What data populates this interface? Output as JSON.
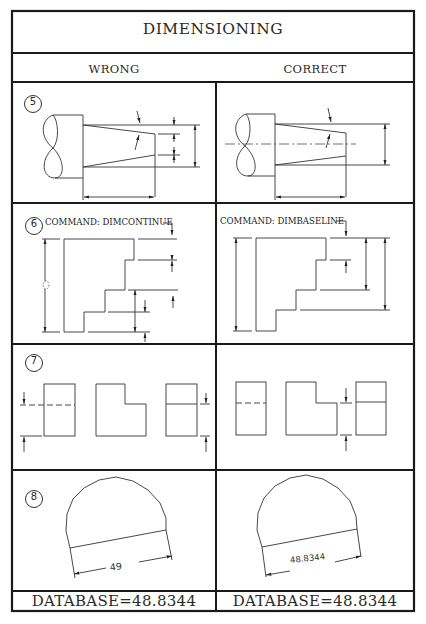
{
  "title": "DIMENSIONING",
  "columns": {
    "wrong": "WRONG",
    "correct": "CORRECT"
  },
  "rows": [
    {
      "number": "5",
      "wrong": {
        "command": ""
      },
      "correct": {
        "command": ""
      }
    },
    {
      "number": "6",
      "wrong": {
        "command": "COMMAND: DIMCONTINUE"
      },
      "correct": {
        "command": "COMMAND: DIMBASELINE"
      }
    },
    {
      "number": "7",
      "wrong": {
        "command": ""
      },
      "correct": {
        "command": ""
      }
    },
    {
      "number": "8",
      "wrong": {
        "dimension_text": "49"
      },
      "correct": {
        "dimension_text": "48.8344"
      }
    }
  ],
  "footer": {
    "wrong": "DATABASE=48.8344",
    "correct": "DATABASE=48.8344"
  },
  "colors": {
    "line": "#1a1a1a",
    "thin_line": "#333333",
    "background": "#ffffff"
  }
}
